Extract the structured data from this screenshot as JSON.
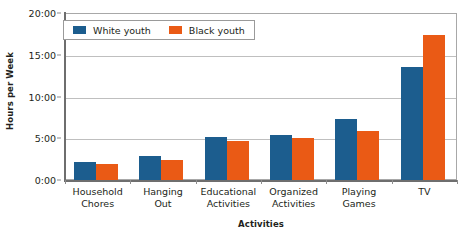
{
  "chart_data": {
    "type": "bar",
    "title": "",
    "subtitle": "",
    "xlabel": "Activities",
    "ylabel": "Hours per Week",
    "categories": [
      "Household Chores",
      "Hanging Out",
      "Educational Activities",
      "Organized Activities",
      "Playing Games",
      "TV"
    ],
    "category_lines": [
      [
        "Household",
        "Chores"
      ],
      [
        "Hanging",
        "Out"
      ],
      [
        "Educational",
        "Activities"
      ],
      [
        "Organized",
        "Activities"
      ],
      [
        "Playing",
        "Games"
      ],
      [
        "TV"
      ]
    ],
    "series": [
      {
        "name": "White youth",
        "color": "#1c5d8e",
        "values": [
          2.1,
          2.9,
          5.2,
          5.4,
          7.3,
          13.5
        ]
      },
      {
        "name": "Black youth",
        "color": "#ea5a15",
        "values": [
          1.9,
          2.4,
          4.7,
          5.0,
          5.9,
          17.4
        ]
      }
    ],
    "ylim": [
      0,
      20
    ],
    "yticks": [
      0,
      5,
      10,
      15,
      20
    ],
    "ytick_labels": [
      "0:00",
      "5:00",
      "10:00",
      "15:00",
      "20:00"
    ],
    "grid": true,
    "grid_axis": "y",
    "legend_position": "top-left",
    "background": "#ffffff",
    "axis_color": "#6e6e6e",
    "grid_color": "#bfbfbf",
    "text_color": "#231f20"
  }
}
